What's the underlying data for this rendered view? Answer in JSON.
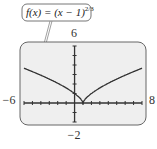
{
  "chart_data": {
    "type": "line",
    "title_parts": {
      "main": "f(x) = (x − 1)",
      "exponent": "2/3"
    },
    "function": "(x-1)^(2/3)",
    "xlim": [
      -6,
      8
    ],
    "ylim": [
      -2,
      6
    ],
    "xscale": 1,
    "yscale": 1,
    "tick_labels": {
      "xmin": "−6",
      "xmax": "8",
      "ymax": "6",
      "ymin": "−2"
    },
    "x": [
      -6,
      -5,
      -4,
      -3,
      -2,
      -1,
      0,
      0.5,
      1,
      1.5,
      2,
      3,
      4,
      5,
      6,
      7,
      8
    ],
    "y": [
      3.66,
      3.3,
      2.92,
      2.52,
      2.08,
      1.59,
      1.0,
      0.63,
      0.0,
      0.63,
      1.0,
      1.59,
      2.08,
      2.52,
      2.92,
      3.3,
      3.66
    ],
    "grid": false,
    "legend": "none",
    "colors": {
      "curve": "#333333",
      "screen": "#efefef",
      "border": "#555555",
      "axis": "#333333"
    }
  }
}
